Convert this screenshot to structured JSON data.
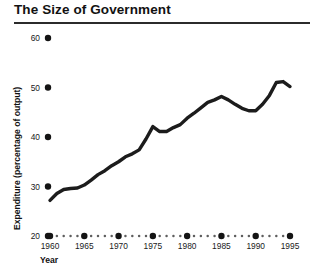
{
  "figure": {
    "title": "The Size of Government",
    "background_color": "#ffffff",
    "rule_color": "#2b2b2b",
    "line_color": "#1c1c1c",
    "text_color": "#121212"
  },
  "axes": {
    "y_title": "Expenditure (percentage of output)",
    "x_title": "Year",
    "y_ticks": [
      "20",
      "30",
      "40",
      "50",
      "60"
    ],
    "x_ticks": [
      "1960",
      "1965",
      "1970",
      "1975",
      "1980",
      "1985",
      "1990",
      "1995"
    ]
  },
  "chart_data": {
    "type": "line",
    "title": "The Size of Government",
    "xlabel": "Year",
    "ylabel": "Expenditure (percentage of output)",
    "xlim": [
      1960,
      1996
    ],
    "ylim": [
      20,
      60
    ],
    "yticks": [
      20,
      30,
      40,
      50,
      60
    ],
    "xticks": [
      1960,
      1965,
      1970,
      1975,
      1980,
      1985,
      1990,
      1995
    ],
    "minor_xtick_interval": 1,
    "grid": false,
    "legend": false,
    "series": [
      {
        "name": "Government expenditure",
        "x": [
          1960,
          1961,
          1962,
          1963,
          1964,
          1965,
          1966,
          1967,
          1968,
          1969,
          1970,
          1971,
          1972,
          1973,
          1974,
          1975,
          1976,
          1977,
          1978,
          1979,
          1980,
          1981,
          1982,
          1983,
          1984,
          1985,
          1986,
          1987,
          1988,
          1989,
          1990,
          1991,
          1992,
          1993,
          1994,
          1995
        ],
        "values": [
          27.2,
          28.6,
          29.4,
          29.6,
          29.7,
          30.3,
          31.3,
          32.4,
          33.2,
          34.2,
          35.0,
          36.0,
          36.6,
          37.4,
          39.6,
          42.1,
          41.1,
          41.1,
          41.9,
          42.5,
          43.8,
          44.8,
          45.9,
          47.0,
          47.5,
          48.2,
          47.5,
          46.6,
          45.8,
          45.3,
          45.3,
          46.6,
          48.4,
          51.0,
          51.2,
          50.2
        ]
      }
    ]
  }
}
